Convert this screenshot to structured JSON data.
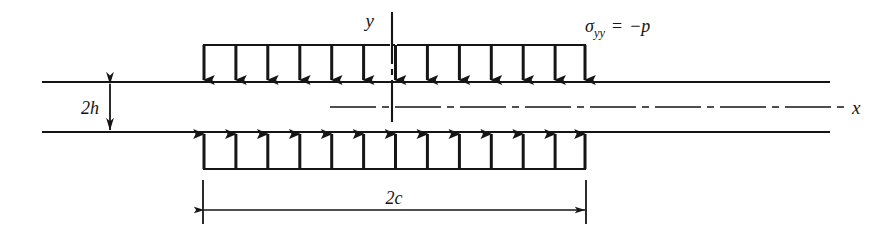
{
  "figure": {
    "axes": {
      "y_label": "y",
      "x_label": "x"
    },
    "labels": {
      "thickness": "2h",
      "load_width": "2c",
      "stress_symbol": "σ",
      "stress_subscript": "yy",
      "stress_equals": "=",
      "stress_value": "−p",
      "stress_full": "σyy = −p"
    },
    "geometry": {
      "plate_left_x": 42,
      "plate_right_x": 830,
      "top_surface_y": 82,
      "bottom_surface_y": 132,
      "origin_x": 392,
      "origin_y": 107,
      "y_axis_top_y": 12,
      "load_left_x": 203,
      "load_right_x": 586,
      "arrow_count_top": 13,
      "arrow_count_bottom": 13,
      "top_load_bar_y": 45,
      "bottom_load_bar_y": 169,
      "dim_2h_x": 110,
      "dim_2c_y": 210,
      "x_label_x": 855,
      "x_label_y": 113,
      "y_label_x": 374,
      "y_label_y": 22,
      "stress_label_x": 585,
      "stress_label_y": 30
    },
    "colors": {
      "ink": "#151515",
      "background": "#ffffff"
    }
  }
}
